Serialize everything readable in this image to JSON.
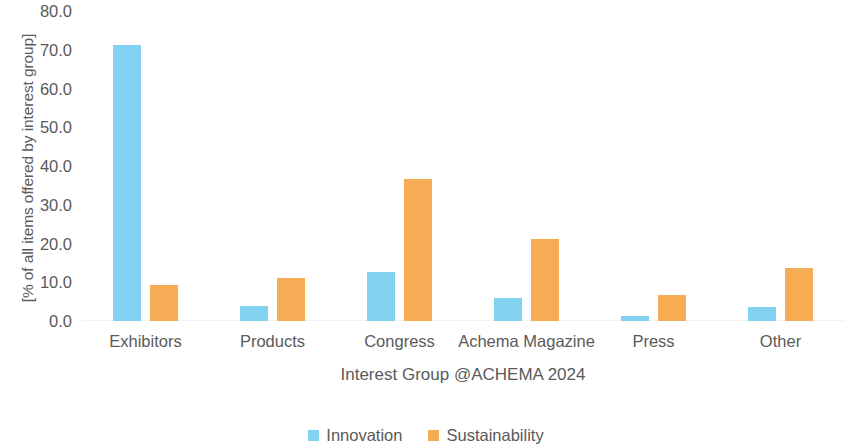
{
  "chart_data": {
    "type": "bar",
    "title": "",
    "xlabel": "Interest Group @ACHEMA 2024",
    "ylabel": "[% of all items offered by interest group]",
    "categories": [
      "Exhibitors",
      "Products",
      "Congress",
      "Achema Magazine",
      "Press",
      "Other"
    ],
    "series": [
      {
        "name": "Innovation",
        "color": "#83d2f2",
        "values": [
          71.2,
          3.9,
          12.6,
          5.9,
          1.3,
          3.6
        ]
      },
      {
        "name": "Sustainability",
        "color": "#f6ac55",
        "values": [
          9.3,
          11.1,
          36.6,
          21.2,
          6.7,
          13.7
        ]
      }
    ],
    "ylim": [
      0.0,
      80.0
    ],
    "ytick_step": 10.0,
    "ytick_labels": [
      "80.0",
      "70.0",
      "60.0",
      "50.0",
      "40.0",
      "30.0",
      "20.0",
      "10.0",
      "0.0"
    ],
    "ytick_values": [
      80.0,
      70.0,
      60.0,
      50.0,
      40.0,
      30.0,
      20.0,
      10.0,
      0.0
    ],
    "grid": false,
    "legend_position": "bottom",
    "legend_entries": [
      "Innovation",
      "Sustainability"
    ]
  },
  "axis": {
    "y_title": "[% of all items offered by interest group]",
    "x_title": "Interest Group @ACHEMA 2024"
  },
  "legend": {
    "items": [
      {
        "label": "Innovation",
        "swatch": "innovation"
      },
      {
        "label": "Sustainability",
        "swatch": "sustainability"
      }
    ]
  },
  "colors": {
    "innovation": "#83d2f2",
    "sustainability": "#f6ac55",
    "text": "#5a5a5a",
    "background": "#ffffff"
  }
}
